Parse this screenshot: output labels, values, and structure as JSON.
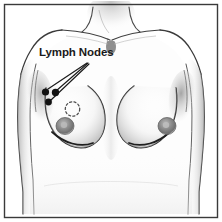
{
  "figure": {
    "title": "Lymph Nodes",
    "type": "medical-illustration",
    "style": "grayscale-pencil-drawing",
    "border_color": "#3a3a3a",
    "background_color": "#ffffff"
  },
  "annotations": {
    "lymph_nodes": {
      "label": "Lymph Nodes",
      "text_color": "#1a1a1a",
      "marker_color": "#111111",
      "marker_count": 3,
      "leader_line_color": "#1a1a1a"
    },
    "lesion_marker": {
      "shape": "dashed-circle",
      "color": "#555555"
    }
  },
  "skin": {
    "fill": "#fbfbfb",
    "shadow": "#cfcfcf",
    "outline": "#2b2b2b",
    "areola": "#8f8f8f"
  }
}
